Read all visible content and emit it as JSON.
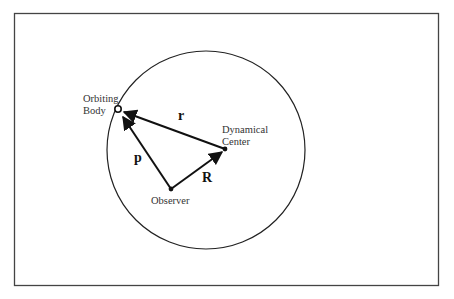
{
  "diagram": {
    "labels": {
      "orbiting_body_line1": "Orbiting",
      "orbiting_body_line2": "Body",
      "dynamical_center_line1": "Dynamical",
      "dynamical_center_line2": "Center",
      "observer": "Observer"
    },
    "vectors": {
      "r": "r",
      "p": "p",
      "R": "R"
    },
    "colors": {
      "stroke": "#111111",
      "frame": "#444444",
      "background": "#ffffff"
    }
  }
}
